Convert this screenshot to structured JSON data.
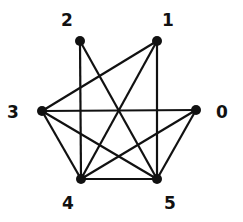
{
  "graph": {
    "nodes": [
      {
        "id": "0",
        "label": "0",
        "x": 196,
        "y": 110,
        "lx": 222,
        "ly": 118
      },
      {
        "id": "1",
        "label": "1",
        "x": 157,
        "y": 41,
        "lx": 168,
        "ly": 26
      },
      {
        "id": "2",
        "label": "2",
        "x": 80,
        "y": 41,
        "lx": 67,
        "ly": 26
      },
      {
        "id": "3",
        "label": "3",
        "x": 42,
        "y": 111,
        "lx": 13,
        "ly": 118
      },
      {
        "id": "4",
        "label": "4",
        "x": 81,
        "y": 179,
        "lx": 68,
        "ly": 209
      },
      {
        "id": "5",
        "label": "5",
        "x": 157,
        "y": 179,
        "lx": 170,
        "ly": 209
      }
    ],
    "edges": [
      [
        "2",
        "4"
      ],
      [
        "2",
        "5"
      ],
      [
        "1",
        "3"
      ],
      [
        "1",
        "4"
      ],
      [
        "1",
        "5"
      ],
      [
        "3",
        "0"
      ],
      [
        "3",
        "4"
      ],
      [
        "3",
        "5"
      ],
      [
        "0",
        "4"
      ],
      [
        "0",
        "5"
      ],
      [
        "4",
        "5"
      ]
    ],
    "colors": {
      "edge": "#111111",
      "node": "#111111"
    }
  }
}
